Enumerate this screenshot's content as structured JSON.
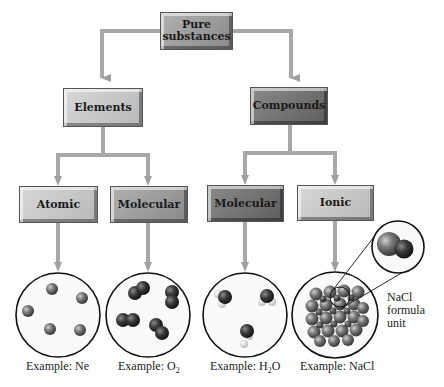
{
  "diagram": {
    "root": {
      "label": "Pure substances"
    },
    "level1": [
      {
        "label": "Elements"
      },
      {
        "label": "Compounds"
      }
    ],
    "level2": [
      {
        "label": "Atomic",
        "parent": "Elements",
        "example": "Example: Ne"
      },
      {
        "label": "Molecular",
        "parent": "Elements",
        "example_prefix": "Example: O",
        "example_sub": "2"
      },
      {
        "label": "Molecular",
        "parent": "Compounds",
        "example_prefix": "Example: H",
        "example_sub": "2",
        "example_suffix": "O"
      },
      {
        "label": "Ionic",
        "parent": "Compounds",
        "example": "Example: NaCl"
      }
    ],
    "callout": {
      "line1": "NaCl",
      "line2": "formula",
      "line3": "unit"
    },
    "colors": {
      "arrow": "#a8a8a8",
      "box_light": "#c8c8c8",
      "box_mid": "#9c9c9c",
      "box_dark": "#6e6e6e",
      "atom": "#6a6a6a"
    }
  }
}
